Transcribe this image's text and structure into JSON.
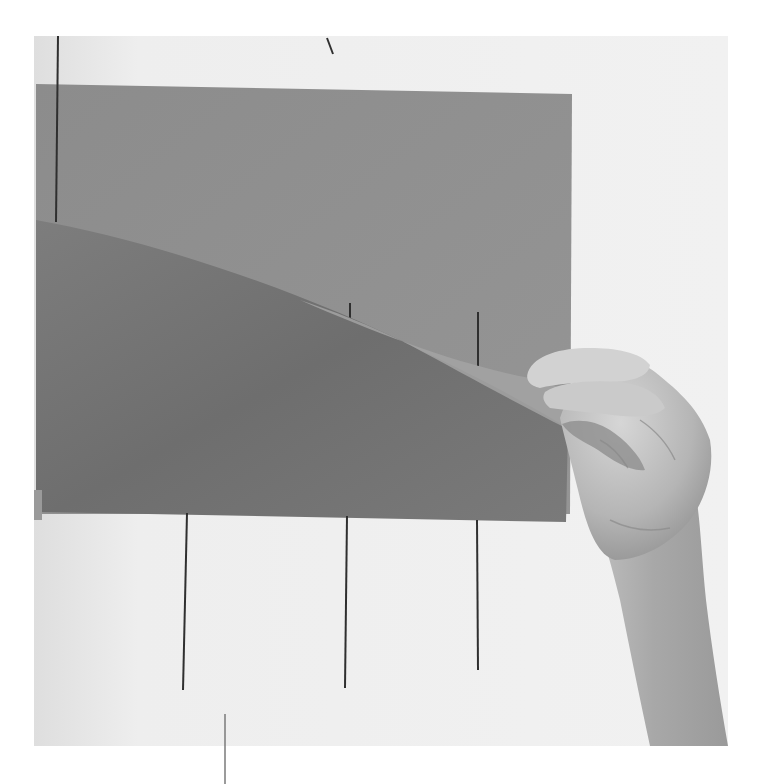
{
  "image": {
    "width": 762,
    "height": 784,
    "description": "Grayscale photograph of a hand peeling a curved sheet of gray paper back from a flat gray sheet mounted on a white wall, with thin dark vertical guide lines",
    "palette": {
      "page_background": "#ffffff",
      "wall": "#ececec",
      "wall_shadow": "#d9d9d9",
      "flat_sheet": "#8f8f8f",
      "curled_sheet": "#7a7a7a",
      "curled_sheet_dark": "#6b6b6b",
      "sheet_edge_highlight": "#a3a3a3",
      "guide_line": "#2f2f2f",
      "skin_light": "#cfcfcf",
      "skin_mid": "#b3b3b3",
      "skin_dark": "#8c8c8c"
    }
  },
  "elements": {
    "wall": {
      "x": 34,
      "y": 36,
      "width": 694,
      "height": 710
    },
    "flat_sheet": {
      "x": 36,
      "y": 84,
      "width": 536,
      "height": 430
    },
    "curled_sheet": {
      "top_left": [
        36,
        220
      ],
      "curl_to": [
        565,
        425
      ],
      "bottom_y": 520
    },
    "guide_lines": [
      {
        "x1": 58,
        "y1": 36,
        "x2": 56,
        "y2": 222
      },
      {
        "x1": 327,
        "y1": 38,
        "x2": 333,
        "y2": 54
      },
      {
        "x1": 350,
        "y1": 303,
        "x2": 350,
        "y2": 322
      },
      {
        "x1": 478,
        "y1": 312,
        "x2": 478,
        "y2": 366
      },
      {
        "x1": 187,
        "y1": 513,
        "x2": 183,
        "y2": 690
      },
      {
        "x1": 347,
        "y1": 516,
        "x2": 345,
        "y2": 688
      },
      {
        "x1": 477,
        "y1": 520,
        "x2": 478,
        "y2": 670
      },
      {
        "x1": 225,
        "y1": 714,
        "x2": 225,
        "y2": 784
      }
    ],
    "hand": {
      "region": {
        "x": 525,
        "y": 345,
        "width": 200,
        "height": 400
      }
    }
  }
}
